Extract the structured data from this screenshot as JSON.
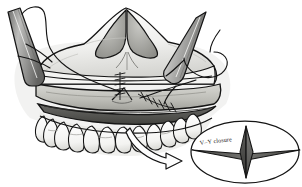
{
  "figure": {
    "background_color": "#ffffff",
    "ink_color": "#1a1a1a",
    "palette": {
      "outline": "#141414",
      "bone_light": "#f2f2f0",
      "bone_mid": "#d9d9d6",
      "mucosa_light": "#cfcfca",
      "mucosa_mid": "#b4b4ae",
      "mucosa_dark": "#8f8f89",
      "cavity_dark": "#5c5c59",
      "cavity_darkest": "#3d3d3b",
      "instrument_light": "#efefef",
      "instrument_mid": "#a8a8a6",
      "instrument_dark": "#6e6e6c",
      "tooth_white": "#fbfbfa",
      "flap_dark": "#4a4a48",
      "flap_mid": "#6f6f6c",
      "arrow_fill": "#fdfdfd"
    }
  },
  "inset": {
    "label": "V–Y closure",
    "shape_name": "v-y-flap-diamond",
    "ellipse": {
      "cx": 245,
      "cy": 152,
      "rx": 54,
      "ry": 31
    }
  },
  "annotations": {
    "arrow_name": "callout-arrow",
    "left_instrument": "retractor-blade-left",
    "right_instrument": "retractor-blade-right",
    "needle": "curved-suture-needle",
    "suture_upper": "suture-line-upper-midline",
    "suture_lower": "suture-line-lower-right",
    "anatomy_nose": "piriform-nasal-aperture",
    "anatomy_maxilla": "maxilla-bone",
    "anatomy_mucosa": "gingival-mucosa-flap",
    "anatomy_teeth": "maxillary-dental-arch",
    "anatomy_cavity": "oral-vestibule-incision"
  }
}
